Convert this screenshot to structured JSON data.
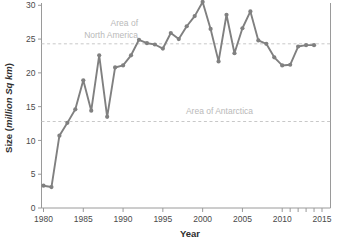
{
  "chart_data": {
    "type": "line",
    "title": "",
    "xlabel": "Year",
    "ylabel": "Size (million Sq km)",
    "ylabel_plain": "Size (",
    "ylabel_italic": "million Sq km",
    "ylabel_close": ")",
    "xlim": [
      1979,
      2015
    ],
    "ylim": [
      0,
      31
    ],
    "x_ticks": [
      1980,
      1985,
      1990,
      1995,
      2000,
      2005,
      2010,
      2015
    ],
    "x_tick_labels": [
      "1980",
      "1985",
      "1990",
      "1995",
      "2000",
      "2005",
      "2010",
      "2015"
    ],
    "y_ticks": [
      0,
      5,
      10,
      15,
      20,
      25,
      30
    ],
    "y_tick_labels": [
      "0",
      "5",
      "10",
      "15",
      "20",
      "25",
      "30"
    ],
    "x_minor_ticks": [
      2011,
      2012,
      2013,
      2014
    ],
    "grid": false,
    "legend": "none",
    "line_color": "#808080",
    "marker_color": "#808080",
    "reference_line_color": "#c8c8c8",
    "axis_color": "#9a9a9a",
    "series": [
      {
        "name": "Ozone hole size",
        "x": [
          1980,
          1981,
          1982,
          1983,
          1984,
          1985,
          1986,
          1987,
          1988,
          1989,
          1990,
          1991,
          1992,
          1993,
          1994,
          1995,
          1996,
          1997,
          1998,
          1999,
          2000,
          2001,
          2002,
          2003,
          2004,
          2005,
          2006,
          2007,
          2008,
          2009,
          2010,
          2011,
          2012,
          2013,
          2014
        ],
        "values": [
          3.3,
          3.1,
          10.7,
          12.6,
          14.6,
          18.9,
          14.4,
          22.6,
          13.5,
          20.8,
          21.1,
          22.6,
          24.9,
          24.4,
          24.2,
          23.6,
          25.9,
          25.0,
          26.9,
          28.4,
          30.5,
          26.5,
          21.7,
          28.6,
          22.9,
          26.6,
          29.1,
          24.8,
          24.3,
          22.3,
          21.1,
          21.2,
          23.9,
          24.1,
          24.1
        ]
      }
    ],
    "reference_lines": [
      {
        "label": "Area of North America",
        "label_lines": [
          "Area of",
          "North America"
        ],
        "value": 24.3
      },
      {
        "label": "Area of Antarctica",
        "label_lines": [
          "Area of Antarctica"
        ],
        "value": 12.8
      }
    ]
  }
}
